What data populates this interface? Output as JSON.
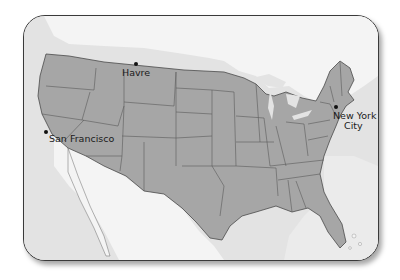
{
  "map": {
    "title": "",
    "region": "Contiguous United States",
    "colors": {
      "land_us": "#a6a6a6",
      "land_other": "#f4f4f4",
      "water": "#e3e3e3",
      "state_border": "#5a5a5a",
      "frame_border": "#3a3a3a"
    },
    "cities": [
      {
        "name": "Havre",
        "label": "Havre"
      },
      {
        "name": "San Francisco",
        "label": "San Francisco"
      },
      {
        "name": "New York City",
        "label_line1": "New York",
        "label_line2": "City"
      }
    ]
  }
}
